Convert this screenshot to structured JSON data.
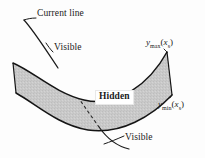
{
  "figure": {
    "name": "hidden-line-surface-diagram",
    "background_color": "#fdfdfd",
    "band_fill_color": "#c9c9c9",
    "band_stroke_color": "#1a1a1a",
    "line_color": "#1a1a1a",
    "width": 205,
    "height": 158
  },
  "labels": {
    "current_line": "Current line",
    "visible_top": "Visible",
    "visible_bottom": "Visible",
    "hidden": "Hidden",
    "y_max": {
      "base": "y",
      "sub": "max",
      "arg_var": "x",
      "arg_sub": "s"
    },
    "y_min": {
      "base": "y",
      "sub": "min",
      "arg_var": "x",
      "arg_sub": "s"
    }
  },
  "graphics": {
    "band_upper_edge": "M 13,63 C 34,72 55,93 84,100 C 118,108 150,83 167,52",
    "band_lower_edge": "M 16,93 C 36,104 58,125 88,130 C 121,135 152,116 172,95",
    "band_left_cap": "M 13,63 L 16,93",
    "band_right_cap": "M 167,52 L 172,95",
    "current_line_upper_visible": "M 22,20 C 36,34 50,56 62,74 C 68,83 74,92 79,99",
    "current_line_hidden_dashed": "M 79,99 C 85,108 92,118 99,127",
    "current_line_lower_visible": "M 99,127 C 107,137 117,145 129,148",
    "leader_current_line": "M 36,17 C 30,18 25,19 22,20",
    "leader_visible_top": "M 62,50 C 58,51 55,52 52,53",
    "leader_visible_bottom": "M 124,139 C 118,142 112,144 106,145"
  }
}
